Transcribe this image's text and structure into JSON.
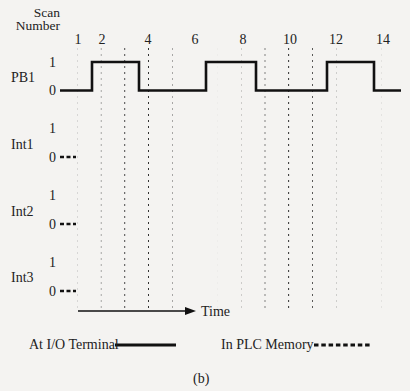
{
  "header": {
    "scan_label_line1": "Scan",
    "scan_label_line2": "Number",
    "scan_numbers": [
      {
        "label": "1",
        "x": 78
      },
      {
        "label": "2",
        "x": 101
      },
      {
        "label": "4",
        "x": 148
      },
      {
        "label": "6",
        "x": 195
      },
      {
        "label": "8",
        "x": 242
      },
      {
        "label": "10",
        "x": 289
      },
      {
        "label": "12",
        "x": 336
      },
      {
        "label": "14",
        "x": 382
      }
    ]
  },
  "signals": [
    {
      "name": "PB1",
      "high_label": "1",
      "low_label": "0",
      "type": "io_terminal",
      "transitions": [
        {
          "from": 60,
          "level": 0
        },
        {
          "at": 92,
          "level": 1
        },
        {
          "at": 139,
          "level": 0
        },
        {
          "at": 206,
          "level": 1
        },
        {
          "at": 256,
          "level": 0
        },
        {
          "at": 327,
          "level": 1
        },
        {
          "at": 374,
          "level": 0
        },
        {
          "to": 401
        }
      ]
    },
    {
      "name": "Int1",
      "high_label": "1",
      "low_label": "0",
      "type": "plc_memory",
      "initial": 0
    },
    {
      "name": "Int2",
      "high_label": "1",
      "low_label": "0",
      "type": "plc_memory",
      "initial": 0
    },
    {
      "name": "Int3",
      "high_label": "1",
      "low_label": "0",
      "type": "plc_memory",
      "initial": 0
    }
  ],
  "time_axis": {
    "label": "Time"
  },
  "legend": {
    "io_terminal": "At I/O Terminal",
    "plc_memory": "In PLC Memory"
  },
  "caption": "(b)",
  "colors": {
    "line": "#111111",
    "dots": "#333333",
    "background": "#f4f3f1"
  }
}
